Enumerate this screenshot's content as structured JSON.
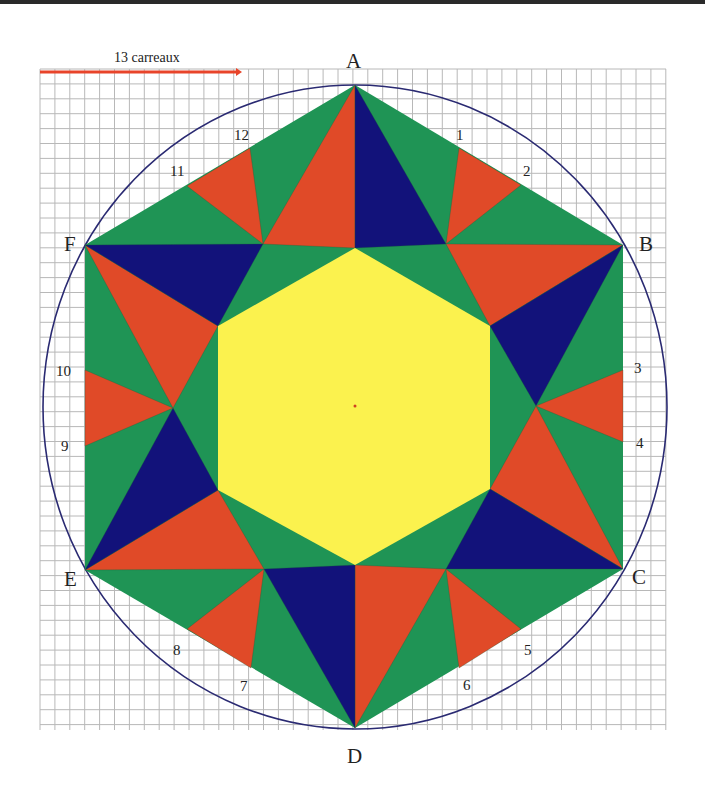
{
  "scale": {
    "label": "13 carreaux",
    "color": "#e8442a"
  },
  "colors": {
    "green": "#1f9455",
    "red": "#e04a28",
    "blue": "#12127a",
    "yellow": "#fbf24e",
    "circle": "#2a2a72",
    "grid": "#b8b8b8",
    "center_dot": "#d04020"
  },
  "vertices": {
    "A": {
      "label": "A",
      "x": 355,
      "y": 85
    },
    "B": {
      "label": "B",
      "x": 623,
      "y": 245
    },
    "C": {
      "label": "C",
      "x": 623,
      "y": 569
    },
    "D": {
      "label": "D",
      "x": 355,
      "y": 728
    },
    "E": {
      "label": "E",
      "x": 85,
      "y": 570
    },
    "F": {
      "label": "F",
      "x": 85,
      "y": 245
    }
  },
  "edge_points": [
    {
      "label": "1",
      "x": 459,
      "y": 148
    },
    {
      "label": "2",
      "x": 521,
      "y": 185
    },
    {
      "label": "3",
      "x": 623,
      "y": 370
    },
    {
      "label": "4",
      "x": 623,
      "y": 442
    },
    {
      "label": "5",
      "x": 521,
      "y": 629
    },
    {
      "label": "6",
      "x": 459,
      "y": 668
    },
    {
      "label": "7",
      "x": 251,
      "y": 668
    },
    {
      "label": "8",
      "x": 187,
      "y": 629
    },
    {
      "label": "9",
      "x": 85,
      "y": 446
    },
    {
      "label": "10",
      "x": 85,
      "y": 370
    },
    {
      "label": "11",
      "x": 187,
      "y": 186
    },
    {
      "label": "12",
      "x": 250,
      "y": 148
    }
  ],
  "labels": {
    "A": "A",
    "B": "B",
    "C": "C",
    "D": "D",
    "E": "E",
    "F": "F",
    "n1": "1",
    "n2": "2",
    "n3": "3",
    "n4": "4",
    "n5": "5",
    "n6": "6",
    "n7": "7",
    "n8": "8",
    "n9": "9",
    "n10": "10",
    "n11": "11",
    "n12": "12"
  },
  "grid": {
    "x0": 40,
    "y0": 69,
    "x1": 666,
    "y1": 730,
    "cell": 14.9
  },
  "circle": {
    "cx": 355,
    "cy": 407,
    "rx": 312,
    "ry": 322
  }
}
